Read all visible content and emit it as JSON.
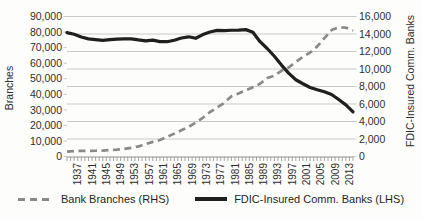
{
  "chart_data": {
    "type": "line",
    "title": "",
    "x_start": 1934,
    "x_end": 2014,
    "x_minor_tick_step": 1,
    "x_tick_labels": [
      "1937",
      "1941",
      "1945",
      "1949",
      "1953",
      "1957",
      "1961",
      "1965",
      "1969",
      "1973",
      "1977",
      "1981",
      "1985",
      "1989",
      "1993",
      "1997",
      "2001",
      "2005",
      "2009",
      "2013"
    ],
    "left_axis": {
      "title": "Branches",
      "min": 0,
      "max": 90000,
      "step": 10000,
      "tick_labels": [
        "90,000",
        "80,000",
        "70,000",
        "60,000",
        "50,000",
        "40,000",
        "30,000",
        "20,000",
        "10,000",
        "0"
      ]
    },
    "right_axis": {
      "title": "FDIC-Insured Comm. Banks",
      "min": 0,
      "max": 16000,
      "step": 2000,
      "tick_labels": [
        "16,000",
        "14,000",
        "12,000",
        "10,000",
        "8,000",
        "6,000",
        "4,000",
        "2,000",
        "0"
      ]
    },
    "grid": {
      "orientation": "horizontal",
      "aligned_to": "right_axis"
    },
    "series": [
      {
        "name": "Bank Branches (RHS)",
        "plotted_axis": "left",
        "line_style": "dashed",
        "color": "#8a8a8a",
        "x": [
          1934,
          1936,
          1938,
          1940,
          1942,
          1944,
          1946,
          1948,
          1950,
          1952,
          1954,
          1956,
          1958,
          1960,
          1962,
          1964,
          1966,
          1968,
          1970,
          1972,
          1974,
          1976,
          1978,
          1980,
          1982,
          1984,
          1986,
          1988,
          1990,
          1992,
          1994,
          1996,
          1998,
          2000,
          2002,
          2004,
          2006,
          2008,
          2010,
          2012,
          2014
        ],
        "y": [
          3100,
          3500,
          3600,
          3600,
          3700,
          3800,
          4100,
          4400,
          4900,
          5600,
          6500,
          7900,
          9400,
          10600,
          12600,
          14700,
          16900,
          19000,
          21800,
          24900,
          28600,
          31500,
          34500,
          38700,
          40500,
          42500,
          44500,
          46800,
          50400,
          52000,
          55100,
          57200,
          60700,
          64100,
          66800,
          70800,
          76100,
          81300,
          83000,
          82800,
          81000
        ]
      },
      {
        "name": "FDIC-Insured Comm. Banks (LHS)",
        "plotted_axis": "right",
        "line_style": "solid",
        "color": "#1f1f1f",
        "x": [
          1934,
          1936,
          1938,
          1940,
          1942,
          1944,
          1946,
          1948,
          1950,
          1952,
          1954,
          1956,
          1958,
          1960,
          1962,
          1964,
          1966,
          1968,
          1970,
          1972,
          1974,
          1976,
          1978,
          1980,
          1982,
          1984,
          1986,
          1988,
          1990,
          1992,
          1994,
          1996,
          1998,
          2000,
          2002,
          2004,
          2006,
          2008,
          2010,
          2012,
          2014
        ],
        "y": [
          14150,
          13970,
          13660,
          13440,
          13350,
          13270,
          13360,
          13420,
          13450,
          13440,
          13320,
          13220,
          13300,
          13130,
          13120,
          13290,
          13540,
          13680,
          13510,
          13930,
          14230,
          14410,
          14390,
          14430,
          14450,
          14500,
          14200,
          13120,
          12340,
          11460,
          10450,
          9530,
          8770,
          8315,
          7890,
          7630,
          7400,
          7090,
          6520,
          5900,
          5100
        ]
      }
    ],
    "legend": [
      {
        "label": "Bank Branches (RHS)",
        "line_style": "dashed",
        "color": "#8a8a8a"
      },
      {
        "label": "FDIC-Insured Comm. Banks (LHS)",
        "line_style": "solid",
        "color": "#1f1f1f"
      }
    ],
    "legend_position": "bottom",
    "colors": {
      "grid": "#c9c9c9",
      "axis": "#8f8f8f",
      "text": "#2d2d2d",
      "background": "#fdfdfb"
    }
  }
}
